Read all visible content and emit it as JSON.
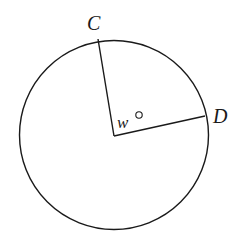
{
  "diagram": {
    "type": "circle-central-angle",
    "points": {
      "C": {
        "label": "C"
      },
      "D": {
        "label": "D"
      }
    },
    "angle_label": "w°",
    "angle_variable": "w",
    "angle_unit": "°"
  },
  "colors": {
    "stroke": "#1a1a1a",
    "background": "#ffffff"
  }
}
